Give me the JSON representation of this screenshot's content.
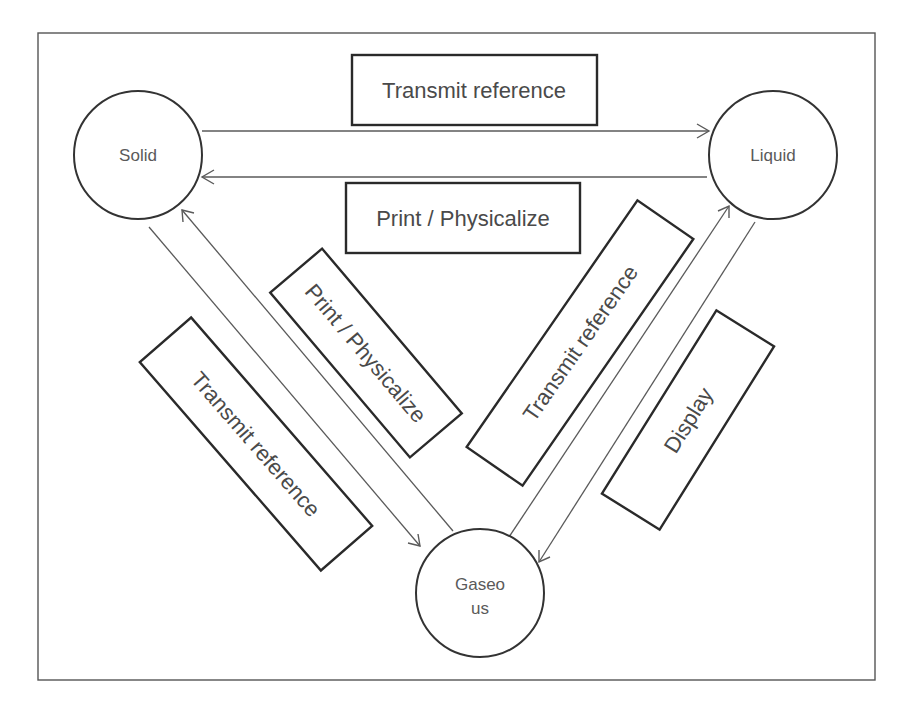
{
  "diagram": {
    "colors": {
      "frame": "#555555",
      "stroke": "#333333",
      "text": "#4a4a4a",
      "arrow": "#5a5a5a",
      "background": "#ffffff"
    },
    "states": {
      "solid": {
        "label": "Solid"
      },
      "liquid": {
        "label": "Liquid"
      },
      "gaseous": {
        "label_line1": "Gaseo",
        "label_line2": "us"
      }
    },
    "transitions": {
      "solid_to_liquid": {
        "label": "Transmit reference"
      },
      "liquid_to_solid": {
        "label": "Print / Physicalize"
      },
      "gaseous_to_solid": {
        "label": "Print / Physicalize"
      },
      "solid_to_gaseous": {
        "label": "Transmit reference"
      },
      "gaseous_to_liquid": {
        "label": "Transmit reference"
      },
      "liquid_to_gaseous": {
        "label": "Display"
      }
    }
  }
}
